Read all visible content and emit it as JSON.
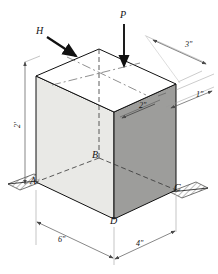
{
  "figure": {
    "type": "engineering-diagram"
  },
  "forces": [
    {
      "id": "P",
      "label": "P",
      "direction": "vertical-down",
      "applied_at": "top-face"
    },
    {
      "id": "H",
      "label": "H",
      "direction": "horizontal-into-page",
      "applied_at": "top-left-corner"
    }
  ],
  "points": {
    "a": "A",
    "b": "B",
    "c": "C",
    "d": "D"
  },
  "dimensions": {
    "height": "2'",
    "bottom_left": "6\"",
    "bottom_right": "4\"",
    "top_right": "3\"",
    "right_offset": "1\"",
    "face_offset": "2\""
  },
  "colors": {
    "line": "#111111",
    "face_light": "#e9e9e6",
    "face_dark": "#9d9d9b",
    "face_top": "#ffffff",
    "ground": "#cfcfcb",
    "dim_line": "#6b6b6b"
  }
}
